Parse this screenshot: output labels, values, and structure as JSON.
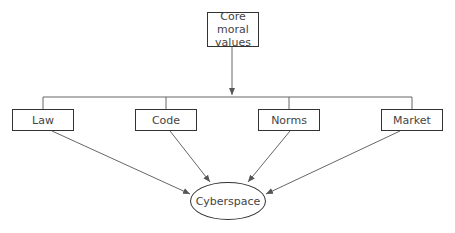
{
  "diagram": {
    "top_node": {
      "label": "Core moral values"
    },
    "top_node_lines": [
      "Core moral",
      "values"
    ],
    "middle_nodes": [
      {
        "label": "Law"
      },
      {
        "label": "Code"
      },
      {
        "label": "Norms"
      },
      {
        "label": "Market"
      }
    ],
    "bottom_node": {
      "label": "Cyberspace"
    },
    "edges": [
      {
        "from": "Core moral values",
        "to": "Law"
      },
      {
        "from": "Core moral values",
        "to": "Code"
      },
      {
        "from": "Core moral values",
        "to": "Norms"
      },
      {
        "from": "Core moral values",
        "to": "Market"
      },
      {
        "from": "Law",
        "to": "Cyberspace"
      },
      {
        "from": "Code",
        "to": "Cyberspace"
      },
      {
        "from": "Norms",
        "to": "Cyberspace"
      },
      {
        "from": "Market",
        "to": "Cyberspace"
      }
    ],
    "colors": {
      "line": "#555555",
      "border": "#333333",
      "text": "#444444"
    }
  }
}
